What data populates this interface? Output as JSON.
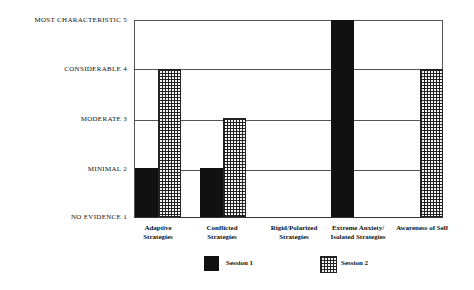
{
  "chart_data": {
    "type": "bar",
    "title": "",
    "xlabel": "",
    "ylabel": "",
    "ylim": [
      1,
      5
    ],
    "y_ticks": [
      {
        "value": 5,
        "label": "MOST CHARACTERISTIC  5"
      },
      {
        "value": 4,
        "label": "CONSIDERABLE  4"
      },
      {
        "value": 3,
        "label": "MODERATE  3"
      },
      {
        "value": 2,
        "label": "MINIMAL  2"
      },
      {
        "value": 1,
        "label": "NO EVIDENCE  1"
      }
    ],
    "categories": [
      "Adaptive Strategies",
      "Conflicted Strategies",
      "Rigid/Polarized Strategies",
      "Extreme Anxiety/ Isolated Strategies",
      "Awareness of Self"
    ],
    "category_lines": [
      [
        "Adaptive",
        "Strategies"
      ],
      [
        "Conflicted",
        "Strategies"
      ],
      [
        "Rigid/Polarized",
        "Strategies"
      ],
      [
        "Extreme Anxiety/",
        "Isolated Strategies"
      ],
      [
        "Awareness of Self",
        ""
      ]
    ],
    "series": [
      {
        "name": "Session 1",
        "fill": "solid black",
        "values": [
          2,
          2,
          1,
          5,
          1
        ]
      },
      {
        "name": "Session 2",
        "fill": "crosshatch",
        "values": [
          4,
          3,
          1,
          1,
          4
        ]
      }
    ],
    "grid": true,
    "legend_position": "bottom"
  },
  "legend": {
    "session1": "Session 1",
    "session2": "Session 2"
  }
}
